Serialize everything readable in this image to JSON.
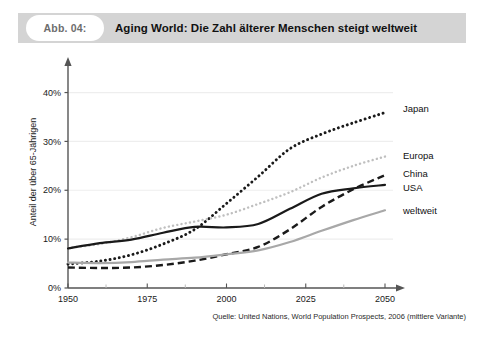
{
  "header": {
    "badge": "Abb. 04:",
    "title": "Aging World: Die Zahl älterer Menschen steigt weltweit"
  },
  "source": "Quelle: United Nations, World Population Prospects, 2006 (mittlere Variante)",
  "colors": {
    "header_bar": "#d4d4d4",
    "badge_bg": "#ffffff",
    "axis": "#555555",
    "grid": "#eeeeee",
    "japan": "#1a1a1a",
    "europa": "#bfbfbf",
    "china": "#1a1a1a",
    "usa": "#1a1a1a",
    "weltweit": "#a8a8a8"
  },
  "chart_data": {
    "type": "line",
    "title": "Aging World: Die Zahl älterer Menschen steigt weltweit",
    "xlabel": "",
    "ylabel": "Anteil der über 65-Jährigen",
    "xlim": [
      1950,
      2050
    ],
    "ylim": [
      0,
      44
    ],
    "xticks": [
      1950,
      1975,
      2000,
      2025,
      2050
    ],
    "xtick_labels": [
      "1950",
      "1975",
      "2000",
      "2025",
      "2050"
    ],
    "yticks": [
      0,
      10,
      20,
      30,
      40
    ],
    "ytick_labels": [
      "0%",
      "10%",
      "20%",
      "30%",
      "40%"
    ],
    "minor_xticks": [
      1962,
      1987,
      2012,
      2037
    ],
    "grid": "horizontal",
    "legend": "inline-right",
    "x": [
      1950,
      1960,
      1970,
      1980,
      1990,
      2000,
      2010,
      2020,
      2030,
      2040,
      2050
    ],
    "series": [
      {
        "name": "Japan",
        "style": "dotted-bold",
        "color": "#1a1a1a",
        "label_value": 36,
        "values": [
          4.9,
          5.5,
          6.8,
          9.0,
          12.0,
          17.3,
          22.8,
          28.5,
          31.5,
          33.8,
          35.9
        ]
      },
      {
        "name": "Europa",
        "style": "dotted-light",
        "color": "#bfbfbf",
        "label_value": 27,
        "values": [
          8.2,
          9.0,
          10.4,
          12.3,
          13.6,
          15.0,
          17.2,
          19.6,
          22.6,
          25.0,
          26.9
        ]
      },
      {
        "name": "China",
        "style": "dashed",
        "color": "#1a1a1a",
        "label_value": 23,
        "values": [
          4.2,
          4.1,
          4.2,
          4.7,
          5.6,
          6.9,
          8.4,
          12.0,
          16.6,
          20.2,
          23.1
        ]
      },
      {
        "name": "USA",
        "style": "solid-bold",
        "color": "#1a1a1a",
        "label_value": 21,
        "values": [
          8.1,
          9.2,
          9.9,
          11.3,
          12.5,
          12.4,
          13.1,
          16.2,
          19.3,
          20.4,
          21.1
        ]
      },
      {
        "name": "weltweit",
        "style": "solid-gray",
        "color": "#a8a8a8",
        "label_value": 16,
        "values": [
          5.2,
          5.1,
          5.3,
          5.8,
          6.2,
          6.9,
          7.7,
          9.4,
          11.7,
          13.9,
          15.9
        ]
      }
    ]
  }
}
